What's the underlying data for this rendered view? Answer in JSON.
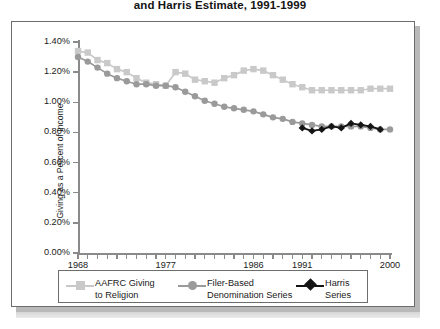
{
  "title": {
    "visible_line": "and Harris Estimate, 1991-1999"
  },
  "axes": {
    "y_title": "Giving as a Percent of Income",
    "y_ticks": [
      "0.00%",
      "0.20%",
      "0.40%",
      "0.60%",
      "0.80%",
      "1.00%",
      "1.20%",
      "1.40%"
    ],
    "x_ticks_labeled": [
      "1968",
      "1977",
      "1986",
      "1991",
      "2000"
    ]
  },
  "legend": {
    "items": [
      {
        "label_line1": "AAFRC Giving",
        "label_line2": "to Religion",
        "marker": "square",
        "color": "#c9c9c9"
      },
      {
        "label_line1": "Filer-Based",
        "label_line2": "Denomination Series",
        "marker": "circle",
        "color": "#9a9a9a"
      },
      {
        "label_line1": "Harris",
        "label_line2": "Series",
        "marker": "diamond",
        "color": "#151515"
      }
    ]
  },
  "chart_data": {
    "type": "line",
    "title": "and Harris Estimate, 1991-1999",
    "xlabel": "",
    "ylabel": "Giving as a Percent of Income",
    "xlim": [
      1968,
      2000
    ],
    "ylim": [
      0.0,
      1.4
    ],
    "ytick_values": [
      0.0,
      0.2,
      0.4,
      0.6,
      0.8,
      1.0,
      1.2,
      1.4
    ],
    "ytick_format": "percent",
    "xtick_labeled_values": [
      1968,
      1977,
      1986,
      1991,
      2000
    ],
    "grid": false,
    "legend_position": "bottom",
    "series": [
      {
        "name": "AAFRC Giving to Religion",
        "marker": "square",
        "color": "#c9c9c9",
        "x": [
          1968,
          1969,
          1970,
          1971,
          1972,
          1973,
          1974,
          1975,
          1976,
          1977,
          1978,
          1979,
          1980,
          1981,
          1982,
          1983,
          1984,
          1985,
          1986,
          1987,
          1988,
          1989,
          1990,
          1991,
          1992,
          1993,
          1994,
          1995,
          1996,
          1997,
          1998,
          1999,
          2000
        ],
        "values": [
          1.34,
          1.33,
          1.28,
          1.26,
          1.22,
          1.2,
          1.16,
          1.13,
          1.12,
          1.11,
          1.2,
          1.19,
          1.15,
          1.14,
          1.13,
          1.16,
          1.18,
          1.21,
          1.22,
          1.21,
          1.18,
          1.15,
          1.12,
          1.1,
          1.08,
          1.08,
          1.08,
          1.08,
          1.08,
          1.08,
          1.09,
          1.09,
          1.09
        ]
      },
      {
        "name": "Filer-Based Denomination Series",
        "marker": "circle",
        "color": "#9a9a9a",
        "x": [
          1968,
          1969,
          1970,
          1971,
          1972,
          1973,
          1974,
          1975,
          1976,
          1977,
          1978,
          1979,
          1980,
          1981,
          1982,
          1983,
          1984,
          1985,
          1986,
          1987,
          1988,
          1989,
          1990,
          1991,
          1992,
          1993,
          1994,
          1995,
          1996,
          1997,
          1998,
          1999,
          2000
        ],
        "values": [
          1.3,
          1.27,
          1.23,
          1.19,
          1.16,
          1.14,
          1.12,
          1.12,
          1.11,
          1.11,
          1.1,
          1.07,
          1.04,
          1.01,
          0.99,
          0.97,
          0.96,
          0.95,
          0.94,
          0.92,
          0.9,
          0.89,
          0.87,
          0.86,
          0.85,
          0.84,
          0.84,
          0.84,
          0.84,
          0.84,
          0.83,
          0.82,
          0.82
        ]
      },
      {
        "name": "Harris Series",
        "marker": "diamond",
        "color": "#151515",
        "x": [
          1991,
          1992,
          1993,
          1994,
          1995,
          1996,
          1997,
          1998,
          1999
        ],
        "values": [
          0.83,
          0.81,
          0.82,
          0.84,
          0.83,
          0.86,
          0.85,
          0.84,
          0.82
        ]
      }
    ]
  }
}
